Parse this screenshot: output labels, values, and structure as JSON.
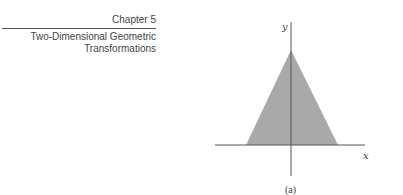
{
  "header": {
    "chapter": "Chapter 5",
    "subtitle_line1": "Two-Dimensional Geometric",
    "subtitle_line2": "Transformations"
  },
  "figure": {
    "caption": "(a)",
    "x_axis_label": "x",
    "y_axis_label": "y",
    "shape": "triangle",
    "fill_color": "#a9a9a9",
    "axis_color": "#555555",
    "triangle_vertices_px": [
      [
        291,
        50
      ],
      [
        246,
        145
      ],
      [
        338,
        145
      ]
    ]
  }
}
